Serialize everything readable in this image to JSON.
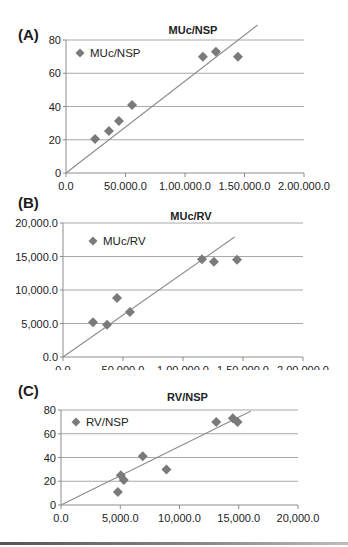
{
  "figure": {
    "panels": [
      {
        "label": "(A)"
      },
      {
        "label": "(B)"
      },
      {
        "label": "(C)"
      }
    ]
  },
  "colors": {
    "marker": "#7a7a7a",
    "trendline": "#8c8c8c",
    "gridline": "#a8a8a8",
    "axis": "#8c8c8c",
    "text": "#222222"
  },
  "chart_data": [
    {
      "panel": "(A)",
      "type": "scatter",
      "title": "MUc/NSP",
      "xlabel": "",
      "ylabel": "",
      "xlim": [
        0,
        200000
      ],
      "ylim": [
        0,
        80
      ],
      "xticks": [
        0,
        50000,
        100000,
        150000,
        200000
      ],
      "xtick_labels": [
        "0.0",
        "50,000.0",
        "1,00,000.0",
        "1,50,000.0",
        "2,00,000.0"
      ],
      "yticks": [
        0,
        20,
        40,
        60,
        80
      ],
      "ytick_labels": [
        "0",
        "20",
        "40",
        "60",
        "80"
      ],
      "grid": "horizontal",
      "legend": {
        "entries": [
          "MUc/NSP"
        ],
        "position": "upper-left-inside"
      },
      "series": [
        {
          "name": "MUc/NSP",
          "marker": "diamond",
          "x": [
            24400,
            36100,
            44500,
            55500,
            115000,
            126000,
            144500
          ],
          "y": [
            20.5,
            25.3,
            31.3,
            40.9,
            70,
            73,
            70
          ]
        }
      ],
      "trendline": {
        "x": [
          0,
          161000
        ],
        "y": [
          0,
          89
        ]
      }
    },
    {
      "panel": "(B)",
      "type": "scatter",
      "title": "MUc/RV",
      "xlabel": "",
      "ylabel": "",
      "xlim": [
        0,
        200000
      ],
      "ylim": [
        0,
        20000
      ],
      "xticks": [
        0,
        50000,
        100000,
        150000,
        200000
      ],
      "xtick_labels": [
        "0.0",
        "50,000.0",
        "1,00,000.0",
        "1,50,000.0",
        "2,00,000.0"
      ],
      "yticks": [
        0,
        5000,
        10000,
        15000,
        20000
      ],
      "ytick_labels": [
        "0.0",
        "5,000.0",
        "10,000.0",
        "15,000.0",
        "20,000.0"
      ],
      "grid": "horizontal",
      "legend": {
        "entries": [
          "MUc/RV"
        ],
        "position": "upper-left-inside"
      },
      "series": [
        {
          "name": "MUc/RV",
          "marker": "diamond",
          "x": [
            25000,
            36700,
            45000,
            55800,
            115800,
            125800,
            145000
          ],
          "y": [
            5200,
            4800,
            8800,
            6700,
            14600,
            14200,
            14500
          ]
        }
      ],
      "trendline": {
        "x": [
          0,
          143000
        ],
        "y": [
          0,
          17900
        ]
      }
    },
    {
      "panel": "(C)",
      "type": "scatter",
      "title": "RV/NSP",
      "xlabel": "",
      "ylabel": "",
      "xlim": [
        0,
        20000
      ],
      "ylim": [
        0,
        80
      ],
      "xticks": [
        0,
        5000,
        10000,
        15000,
        20000
      ],
      "xtick_labels": [
        "0.0",
        "5,000.0",
        "10,000.0",
        "15,000.0",
        "20,000.0"
      ],
      "yticks": [
        0,
        20,
        40,
        60,
        80
      ],
      "ytick_labels": [
        "0",
        "20",
        "40",
        "60",
        "80"
      ],
      "grid": "horizontal",
      "legend": {
        "entries": [
          "RV/NSP"
        ],
        "position": "upper-left-inside"
      },
      "series": [
        {
          "name": "RV/NSP",
          "marker": "diamond",
          "x": [
            4800,
            5050,
            5300,
            6900,
            8900,
            13100,
            14500,
            14900
          ],
          "y": [
            11,
            25,
            21,
            41,
            30,
            70,
            73,
            70
          ]
        }
      ],
      "trendline": {
        "x": [
          0,
          16000
        ],
        "y": [
          0,
          79
        ]
      }
    }
  ]
}
